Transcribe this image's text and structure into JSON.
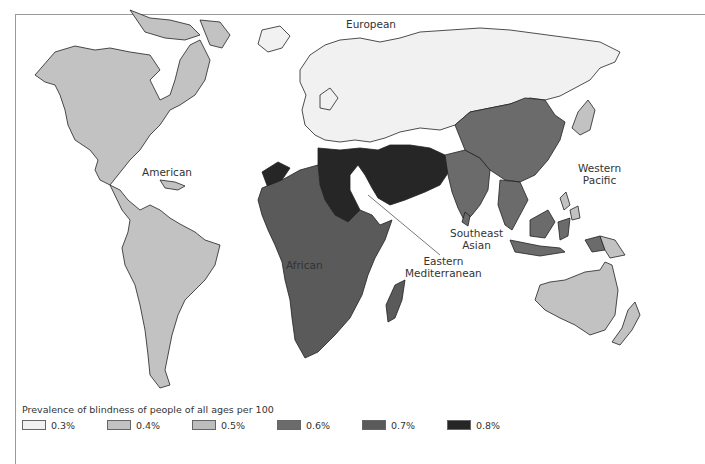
{
  "figure": {
    "title": "Prevalence of blindness of people of all ages per 100"
  },
  "colors": {
    "p03": "#f1f1f1",
    "p04": "#c2c2c2",
    "p05": "#bdbdbd",
    "p06": "#6b6b6b",
    "p07": "#5a5a5a",
    "p08": "#262626"
  },
  "regions": [
    {
      "name": "European",
      "prevalence": "0.3%"
    },
    {
      "name": "American",
      "prevalence": "0.4%"
    },
    {
      "name": "Western Pacific",
      "prevalence": "0.4%"
    },
    {
      "name": "Southeast Asian",
      "prevalence": "0.6%"
    },
    {
      "name": "African",
      "prevalence": "0.7%"
    },
    {
      "name": "Eastern Mediterranean",
      "prevalence": "0.8%"
    }
  ],
  "labels": {
    "european": "European",
    "american": "American",
    "western_pacific_1": "Western",
    "western_pacific_2": "Pacific",
    "southeast_asian_1": "Southeast",
    "southeast_asian_2": "Asian",
    "african": "African",
    "eastern_med_1": "Eastern",
    "eastern_med_2": "Mediterranean"
  },
  "legend": {
    "title": "Prevalence of blindness of people of all ages per 100",
    "items": [
      {
        "label": "0.3%",
        "color": "#f1f1f1"
      },
      {
        "label": "0.4%",
        "color": "#c2c2c2"
      },
      {
        "label": "0.5%",
        "color": "#bdbdbd"
      },
      {
        "label": "0.6%",
        "color": "#6b6b6b"
      },
      {
        "label": "0.7%",
        "color": "#5a5a5a"
      },
      {
        "label": "0.8%",
        "color": "#262626"
      }
    ]
  }
}
